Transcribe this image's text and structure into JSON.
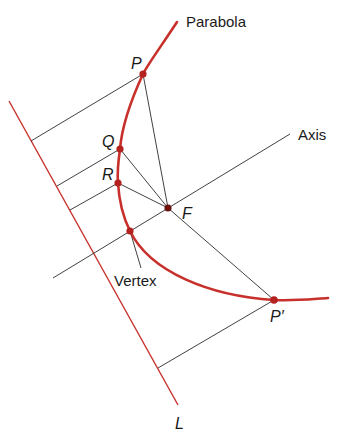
{
  "diagram": {
    "colors": {
      "curve": "#c7302b",
      "directrix": "#c7302b",
      "lines": "#2b2b2b",
      "points": "#b3221e",
      "text": "#1a1a1a"
    },
    "labels": {
      "parabola": "Parabola",
      "axis": "Axis",
      "vertex": "Vertex",
      "directrix": "L",
      "focus": "F",
      "point_p": "P",
      "point_q": "Q",
      "point_r": "R",
      "point_p_prime": "P′"
    },
    "points": [
      {
        "id": "P",
        "x": 143,
        "y": 74
      },
      {
        "id": "Q",
        "x": 120,
        "y": 149
      },
      {
        "id": "R",
        "x": 118,
        "y": 183
      },
      {
        "id": "Vertex",
        "x": 130,
        "y": 231
      },
      {
        "id": "F",
        "x": 168,
        "y": 208
      },
      {
        "id": "P'",
        "x": 274,
        "y": 300
      }
    ],
    "directrix_line": {
      "x1": 9,
      "y1": 101,
      "x2": 178,
      "y2": 405
    },
    "axis_line": {
      "x1": 53,
      "y1": 278,
      "x2": 290,
      "y2": 134
    }
  }
}
